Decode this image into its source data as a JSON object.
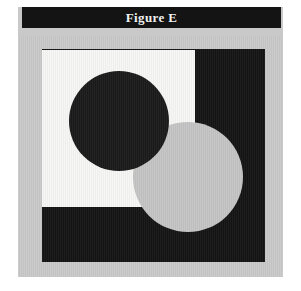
{
  "figure": {
    "caption": "Figure E",
    "caption_bar_color": "#141414",
    "caption_text_color": "#f2f2f2",
    "mount_color": "#c9c9c9",
    "page_color": "#ffffff"
  },
  "shapes": {
    "black_square": {
      "name": "black square",
      "color": "#141414",
      "x": 42,
      "y": 49,
      "width": 223,
      "height": 213
    },
    "white_square": {
      "name": "white square",
      "color": "#f6f6f4",
      "x": 42,
      "y": 50,
      "width": 153,
      "height": 157
    },
    "black_circle": {
      "name": "black circle",
      "color": "#1a1a1a",
      "cx": 119,
      "cy": 121,
      "r": 50
    },
    "gray_circle": {
      "name": "gray circle",
      "color": "#c4c4c4",
      "cx": 188,
      "cy": 177,
      "r": 55
    }
  }
}
